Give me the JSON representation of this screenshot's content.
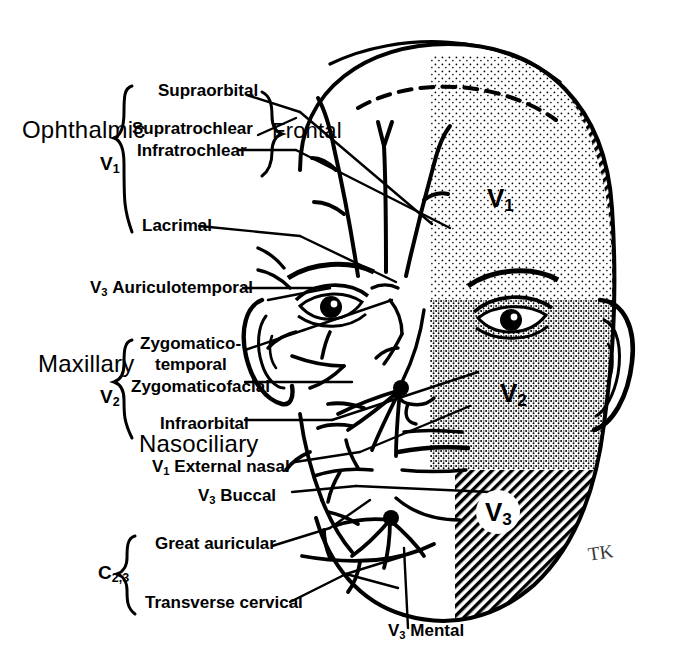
{
  "figure": {
    "signature": "TK",
    "ink_color": "#000000",
    "background_color": "#ffffff"
  },
  "divisions": [
    {
      "name": "Ophthalmic",
      "symbol": "V",
      "symbol_sub": "1",
      "branches": [
        "Supraorbital",
        "Supratrochlear",
        "Infratrochlear",
        "Lacrimal"
      ]
    },
    {
      "name": "Maxillary",
      "symbol": "V",
      "symbol_sub": "2",
      "branches": [
        "Zygomatico-",
        "temporal",
        "Zygomaticofacial",
        "Infraorbital"
      ]
    },
    {
      "name": "Nasociliary",
      "symbol": "",
      "symbol_sub": "",
      "branches": []
    },
    {
      "name": "",
      "symbol": "C",
      "symbol_sub": "2,3",
      "branches": [
        "Great auricular",
        "Transverse cervical"
      ]
    }
  ],
  "labels": {
    "ophthalmic": "Ophthalmic",
    "ophthalmic_sym": "V",
    "ophthalmic_sub": "1",
    "supraorbital": "Supraorbital",
    "supratrochlear": "Supratrochlear",
    "infratrochlear": "Infratrochlear",
    "frontal": "Frontal",
    "lacrimal": "Lacrimal",
    "auriculotemporal_sym": "V",
    "auriculotemporal_sub": "3",
    "auriculotemporal": "Auriculotemporal",
    "maxillary": "Maxillary",
    "maxillary_sym": "V",
    "maxillary_sub": "2",
    "zygomatico": "Zygomatico-",
    "temporal": "temporal",
    "zygomaticofacial": "Zygomaticofacial",
    "infraorbital": "Infraorbital",
    "nasociliary": "Nasociliary",
    "external_nasal_sym": "V",
    "external_nasal_sub": "1",
    "external_nasal": "External nasal",
    "buccal_sym": "V",
    "buccal_sub": "3",
    "buccal": "Buccal",
    "cervical_sym": "C",
    "cervical_sub": "2,3",
    "great_auricular": "Great auricular",
    "transverse_cervical": "Transverse cervical",
    "mental_sym": "V",
    "mental_sub": "3",
    "mental": "Mental"
  },
  "face_regions": [
    {
      "id": "v1",
      "symbol": "V",
      "sub": "1",
      "shading": "stipple",
      "description": "Ophthalmic division territory — forehead and upper eyelid"
    },
    {
      "id": "v2",
      "symbol": "V",
      "sub": "2",
      "shading": "dense-stipple",
      "description": "Maxillary division territory — cheek, lower eyelid, upper lip"
    },
    {
      "id": "v3",
      "symbol": "V",
      "sub": "3",
      "shading": "hatch",
      "description": "Mandibular division territory — jaw, lower lip, chin"
    }
  ]
}
